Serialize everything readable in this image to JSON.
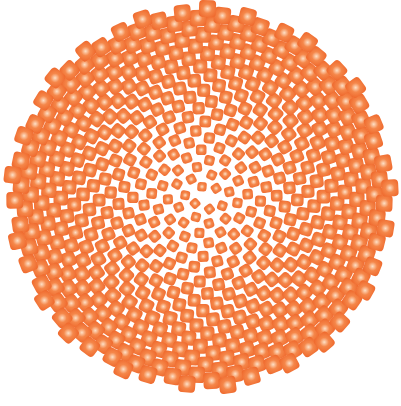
{
  "figure": {
    "width": 401,
    "height": 406,
    "background": "#ffffff",
    "center": [
      201,
      198
    ],
    "outer_radius": 190,
    "seed_count": 560,
    "golden_angle_deg": 137.508,
    "outer_seed_size": 17,
    "inner_seed_size": 9,
    "seed_corner_radius": 4,
    "colors": {
      "edge": "#ef6a2e",
      "mid": "#f5874a",
      "core": "#fde0c6",
      "gap": "#ffffff"
    }
  }
}
